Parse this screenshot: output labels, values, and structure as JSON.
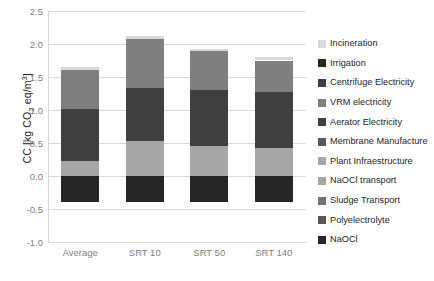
{
  "chart_data": {
    "type": "bar",
    "subtype": "stacked",
    "title": "",
    "xlabel": "",
    "ylabel": "CC [kg CO2 eq/m3]",
    "ylabel_parts": {
      "prefix": "CC [kg CO",
      "sub": "2",
      "mid": " eq/m",
      "sup": "3",
      "suffix": "]"
    },
    "ylim": [
      -1.0,
      2.5
    ],
    "yticks": [
      "2.5",
      "2.0",
      "1.5",
      "1.0",
      "0.5",
      "0.0",
      "-0.5",
      "-1.0"
    ],
    "ytick_values": [
      2.5,
      2.0,
      1.5,
      1.0,
      0.5,
      0.0,
      -0.5,
      -1.0
    ],
    "grid": true,
    "legend_position": "right",
    "categories": [
      "Average",
      "SRT 10",
      "SRT 50",
      "SRT 140"
    ],
    "series": [
      {
        "name": "Incineration",
        "color": "#d9d9d9",
        "values": [
          0.04,
          0.05,
          0.04,
          0.05
        ]
      },
      {
        "name": "Irrigation",
        "color": "#262626",
        "values": [
          0.0,
          0.0,
          0.0,
          0.0
        ]
      },
      {
        "name": "Centrifuge Electricity",
        "color": "#404040",
        "values": [
          0.0,
          0.0,
          0.0,
          0.0
        ]
      },
      {
        "name": "VRM electricity",
        "color": "#7f7f7f",
        "values": [
          0.6,
          0.74,
          0.58,
          0.48
        ]
      },
      {
        "name": "Aerator Electricity",
        "color": "#404040",
        "values": [
          0.79,
          0.8,
          0.85,
          0.84
        ]
      },
      {
        "name": "Membrane Manufacture",
        "color": "#595959",
        "values": [
          0.0,
          0.0,
          0.0,
          0.0
        ]
      },
      {
        "name": "Plant Infraestructure",
        "color": "#a6a6a6",
        "values": [
          0.22,
          0.53,
          0.46,
          0.43
        ]
      },
      {
        "name": "NaOCl transport",
        "color": "#a6a6a6",
        "values": [
          0.0,
          0.0,
          0.0,
          0.0
        ]
      },
      {
        "name": "Sludge Transport",
        "color": "#737373",
        "values": [
          0.0,
          0.0,
          0.0,
          0.0
        ]
      },
      {
        "name": "Polyelectrolyte",
        "color": "#595959",
        "values": [
          0.0,
          0.0,
          0.0,
          0.0
        ]
      },
      {
        "name": "NaOCl",
        "color": "#262626",
        "values": [
          -0.4,
          -0.4,
          -0.4,
          -0.4
        ]
      }
    ],
    "stack_segments": [
      {
        "category": "Average",
        "positive": [
          {
            "name": "Plant Infraestructure",
            "color": "#a6a6a6",
            "from": 0.0,
            "to": 0.22
          },
          {
            "name": "Aerator Electricity",
            "color": "#404040",
            "from": 0.22,
            "to": 1.01
          },
          {
            "name": "VRM electricity",
            "color": "#7f7f7f",
            "from": 1.01,
            "to": 1.61
          },
          {
            "name": "Incineration",
            "color": "#d9d9d9",
            "from": 1.61,
            "to": 1.65
          }
        ],
        "negative": [
          {
            "name": "NaOCl",
            "color": "#262626",
            "from": 0.0,
            "to": -0.4
          }
        ],
        "net_total": 1.25,
        "gross_top": 1.65,
        "gross_bottom": -0.4
      },
      {
        "category": "SRT 10",
        "positive": [
          {
            "name": "Plant Infraestructure",
            "color": "#a6a6a6",
            "from": 0.0,
            "to": 0.53
          },
          {
            "name": "Aerator Electricity",
            "color": "#404040",
            "from": 0.53,
            "to": 1.33
          },
          {
            "name": "VRM electricity",
            "color": "#7f7f7f",
            "from": 1.33,
            "to": 2.07
          },
          {
            "name": "Incineration",
            "color": "#d9d9d9",
            "from": 2.07,
            "to": 2.12
          }
        ],
        "negative": [
          {
            "name": "NaOCl",
            "color": "#262626",
            "from": 0.0,
            "to": -0.4
          }
        ],
        "net_total": 1.72,
        "gross_top": 2.12,
        "gross_bottom": -0.4
      },
      {
        "category": "SRT 50",
        "positive": [
          {
            "name": "Plant Infraestructure",
            "color": "#a6a6a6",
            "from": 0.0,
            "to": 0.46
          },
          {
            "name": "Aerator Electricity",
            "color": "#404040",
            "from": 0.46,
            "to": 1.31
          },
          {
            "name": "VRM electricity",
            "color": "#7f7f7f",
            "from": 1.31,
            "to": 1.89
          },
          {
            "name": "Incineration",
            "color": "#d9d9d9",
            "from": 1.89,
            "to": 1.93
          }
        ],
        "negative": [
          {
            "name": "NaOCl",
            "color": "#262626",
            "from": 0.0,
            "to": -0.4
          }
        ],
        "net_total": 1.53,
        "gross_top": 1.93,
        "gross_bottom": -0.4
      },
      {
        "category": "SRT 140",
        "positive": [
          {
            "name": "Plant Infraestructure",
            "color": "#a6a6a6",
            "from": 0.0,
            "to": 0.43
          },
          {
            "name": "Aerator Electricity",
            "color": "#404040",
            "from": 0.43,
            "to": 1.27
          },
          {
            "name": "VRM electricity",
            "color": "#7f7f7f",
            "from": 1.27,
            "to": 1.75
          },
          {
            "name": "Incineration",
            "color": "#d9d9d9",
            "from": 1.75,
            "to": 1.8
          }
        ],
        "negative": [
          {
            "name": "NaOCl",
            "color": "#262626",
            "from": 0.0,
            "to": -0.4
          }
        ],
        "net_total": 1.4,
        "gross_top": 1.8,
        "gross_bottom": -0.4
      }
    ]
  },
  "colors": {
    "background": "#ffffff",
    "gridline": "#d9d9d9",
    "tick_text": "#7f7f7f",
    "axis_title_text": "#262626",
    "legend_text": "#262626"
  }
}
